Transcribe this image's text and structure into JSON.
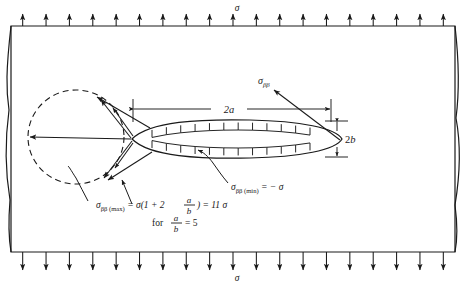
{
  "figure": {
    "type": "engineering-stress-diagram",
    "background_color": "#ffffff",
    "line_color": "#1a1a1a"
  },
  "plate": {
    "name": "plate-boundary",
    "x": 11,
    "y": 26,
    "width": 444,
    "height": 226
  },
  "loading": {
    "top": {
      "label": "σ",
      "label_x": 237,
      "label_y": 10,
      "arrow_count": 19,
      "direction": "up"
    },
    "bottom": {
      "label": "σ",
      "label_x": 237,
      "label_y": 279,
      "arrow_count": 19,
      "direction": "down"
    }
  },
  "ellipse": {
    "name": "elliptical-hole",
    "cx": 237,
    "cy": 139,
    "rx": 105,
    "ry": 18
  },
  "dashed_lobe": {
    "name": "stress-distribution-lobe",
    "cx": 76,
    "cy": 137,
    "rx": 48,
    "ry": 47
  },
  "dimensions": [
    {
      "name": "major-axis-dimension",
      "label": "2a",
      "label_x": 228,
      "label_y": 107,
      "x1": 132,
      "x2": 330,
      "y": 109
    },
    {
      "name": "minor-axis-dimension",
      "label": "2b",
      "label_x": 344,
      "label_y": 144,
      "x": 336,
      "y1": 124,
      "y2": 156
    }
  ],
  "annotations": {
    "sigma_beta_beta": {
      "name": "sigma-beta-beta-label",
      "base": "σ",
      "sub": "ββ",
      "x": 258,
      "y": 84
    },
    "sigma_min": {
      "name": "sigma-min-label",
      "text": "σ",
      "sub": "ββ (min)",
      "rest": " = − σ",
      "x": 230,
      "y": 187
    },
    "sigma_max": {
      "name": "sigma-max-label",
      "text": "σ",
      "sub": "ββ (max)",
      "x": 88,
      "y": 205
    }
  },
  "equation": {
    "name": "stress-concentration-equation",
    "sigma": "σ",
    "sub": "ββ (max)",
    "eq1": " = σ(1 + 2",
    "frac_num_1": "a",
    "frac_den_1": "b",
    "eq2": ") = 11 σ",
    "condition_prefix": "for ",
    "frac_num_2": "a",
    "frac_den_2": "b",
    "condition_suffix": " = 5"
  }
}
